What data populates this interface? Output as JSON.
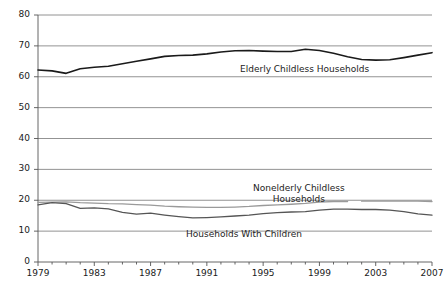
{
  "chart_data": {
    "type": "line",
    "title": "",
    "subtitle": "",
    "xlabel": "",
    "ylabel": "",
    "xlim": [
      1979,
      2007
    ],
    "ylim": [
      0,
      80
    ],
    "ytick_step": 10,
    "grid": "horizontal",
    "legend_position": "inline-annotations",
    "x": [
      1979,
      1980,
      1981,
      1982,
      1983,
      1984,
      1985,
      1986,
      1987,
      1988,
      1989,
      1990,
      1991,
      1992,
      1993,
      1994,
      1995,
      1996,
      1997,
      1998,
      1999,
      2000,
      2001,
      2002,
      2003,
      2004,
      2005,
      2006,
      2007
    ],
    "ytick_labels": [
      "0",
      "10",
      "20",
      "30",
      "40",
      "50",
      "60",
      "70",
      "80"
    ],
    "xtick_labels": [
      "1979",
      "1983",
      "1987",
      "1991",
      "1995",
      "1999",
      "2003",
      "2007"
    ],
    "xtick_years": [
      1979,
      1983,
      1987,
      1991,
      1995,
      1999,
      2003,
      2007
    ],
    "series": [
      {
        "name": "Elderly Childless Households",
        "color": "#1a1a1a",
        "width": 1.6,
        "label_x": 240,
        "label_y": 64,
        "values": [
          62.2,
          61.9,
          61.1,
          62.6,
          63.1,
          63.4,
          64.2,
          65.0,
          65.8,
          66.6,
          66.9,
          67.0,
          67.4,
          68.0,
          68.4,
          68.5,
          68.3,
          68.2,
          68.2,
          68.9,
          68.5,
          67.6,
          66.5,
          65.6,
          65.4,
          65.5,
          66.2,
          67.0,
          67.8
        ]
      },
      {
        "name": "Nonelderly Childless Households",
        "color": "#9a9a9a",
        "width": 1.3,
        "label_x": 253,
        "label_y": 183,
        "break_after_year": 2001,
        "values": [
          19.3,
          19.4,
          19.5,
          19.2,
          19.1,
          18.9,
          18.8,
          18.6,
          18.4,
          18.1,
          17.9,
          17.8,
          17.7,
          17.7,
          17.8,
          18.0,
          18.3,
          18.5,
          18.7,
          19.0,
          19.4,
          19.6,
          19.6,
          19.7,
          19.7,
          19.7,
          19.7,
          19.7,
          19.6
        ]
      },
      {
        "name": "Households With Children",
        "color": "#555555",
        "width": 1.3,
        "label_x": 186,
        "label_y": 229,
        "values": [
          18.5,
          19.2,
          18.9,
          17.4,
          17.5,
          17.2,
          16.1,
          15.5,
          15.8,
          15.2,
          14.7,
          14.3,
          14.4,
          14.6,
          14.9,
          15.2,
          15.7,
          16.0,
          16.2,
          16.3,
          16.8,
          17.1,
          17.1,
          17.0,
          17.0,
          16.8,
          16.3,
          15.6,
          15.2
        ]
      }
    ]
  },
  "geometry": {
    "plot_left": 38,
    "plot_right": 432,
    "plot_top": 15,
    "plot_bottom": 262
  }
}
